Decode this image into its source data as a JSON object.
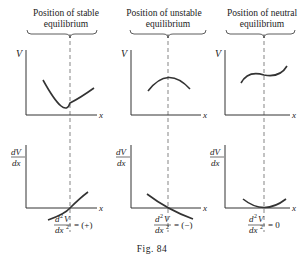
{
  "panels": [
    {
      "title_line1": "Position of stable",
      "title_line2": "equilibrium",
      "second_derivative": "= (+)"
    },
    {
      "title_line1": "Position of unstable",
      "title_line2": "equilibrium",
      "second_derivative": "= (−)"
    },
    {
      "title_line1": "Position of neutral",
      "title_line2": "equilibrium",
      "second_derivative": "= 0"
    }
  ],
  "axis_labels": {
    "V": "V",
    "x": "x",
    "dV": "dV",
    "dx": "dx",
    "d2V": "d",
    "sup2": "2",
    "V2": "V",
    "dx2": "dx",
    "dx2sup": "2"
  },
  "caption": "Fig. 84"
}
